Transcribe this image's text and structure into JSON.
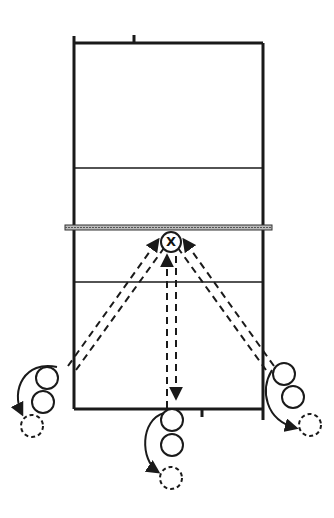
{
  "diagram": {
    "title": "",
    "type": "volleyball passing drill",
    "colors": {
      "line": "#1a1a1a",
      "net": "#888888",
      "background": "#ffffff"
    },
    "court": {
      "left_x": 74,
      "right_x": 263,
      "top_y": 43,
      "net_y": 227,
      "attack_line_top_y": 168,
      "attack_line_bottom_y": 282,
      "bottom_y": 409
    },
    "setter": {
      "label": "X",
      "x": 171,
      "y": 242,
      "r": 10
    },
    "groups": [
      {
        "name": "left-line",
        "players": [
          {
            "x": 47,
            "y": 378
          },
          {
            "x": 43,
            "y": 402
          }
        ],
        "target": {
          "x": 30,
          "y": 425
        },
        "pass_from": {
          "x": 70,
          "y": 368
        }
      },
      {
        "name": "middle-line",
        "players": [
          {
            "x": 172,
            "y": 420
          },
          {
            "x": 172,
            "y": 445
          }
        ],
        "target": {
          "x": 171,
          "y": 478
        },
        "pass_from": {
          "x": 172,
          "y": 408
        }
      },
      {
        "name": "right-line",
        "players": [
          {
            "x": 284,
            "y": 374
          },
          {
            "x": 293,
            "y": 397
          }
        ],
        "target": {
          "x": 308,
          "y": 425
        },
        "pass_from": {
          "x": 270,
          "y": 368
        }
      }
    ]
  }
}
